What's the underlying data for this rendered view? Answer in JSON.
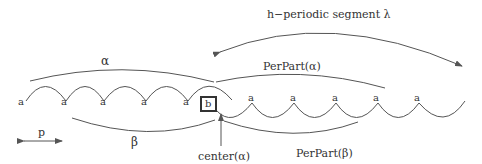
{
  "diagram": {
    "colors": {
      "stroke": "#555555",
      "text": "#333333",
      "box": "#333333",
      "background": "#ffffff"
    },
    "labels": {
      "h_periodic": "h−periodic segment λ",
      "alpha": "α",
      "perpart_alpha": "PerPart(α)",
      "beta": "β",
      "perpart_beta": "PerPart(β)",
      "center_alpha": "center(α)",
      "p": "p",
      "b": "b"
    },
    "upper_sequence": [
      "a",
      "a",
      "a",
      "a",
      "a"
    ],
    "lower_sequence": [
      "a",
      "a",
      "a",
      "a",
      "a"
    ]
  }
}
